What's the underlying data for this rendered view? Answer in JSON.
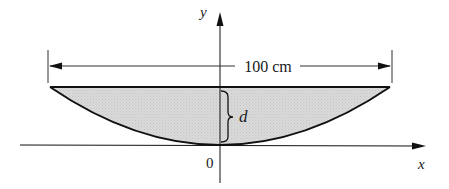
{
  "figure": {
    "labels": {
      "y_axis": "y",
      "x_axis": "x",
      "origin": "0",
      "width_dimension": "100 cm",
      "depth": "d"
    },
    "colors": {
      "fill": "#d4d4d4",
      "stroke": "#111111",
      "background": "#ffffff"
    }
  }
}
